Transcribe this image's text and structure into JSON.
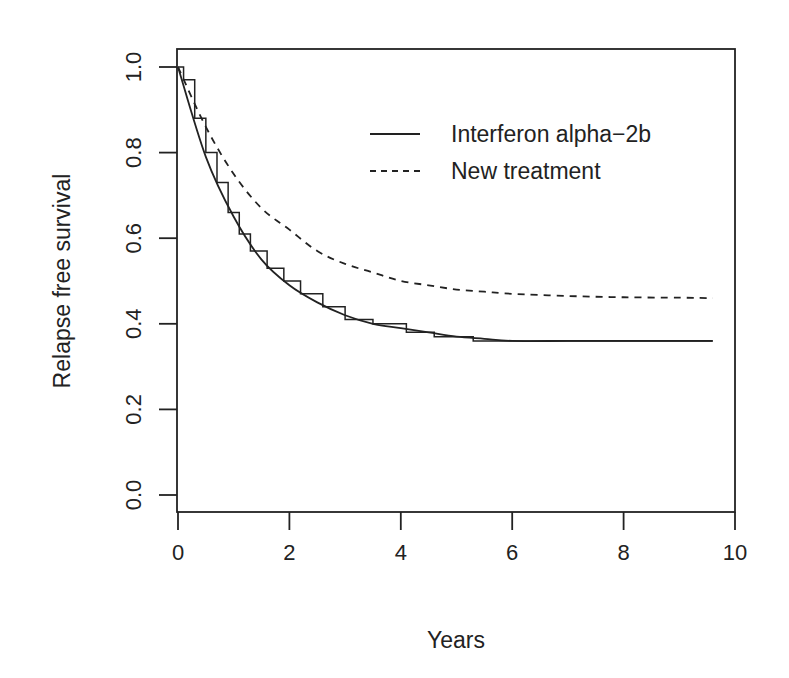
{
  "chart_data": {
    "type": "line",
    "title": "",
    "xlabel": "Years",
    "ylabel": "Relapse free survival",
    "xlim": [
      0,
      10
    ],
    "ylim": [
      0,
      1
    ],
    "x_ticks": [
      "0",
      "2",
      "4",
      "6",
      "8",
      "10"
    ],
    "y_ticks": [
      "0.0",
      "0.2",
      "0.4",
      "0.6",
      "0.8",
      "1.0"
    ],
    "grid": false,
    "legend_position": "top-right",
    "series": [
      {
        "name": "Interferon alpha-2b",
        "style": "solid",
        "x": [
          0,
          0.5,
          1,
          1.5,
          2,
          2.5,
          3,
          3.5,
          4,
          4.5,
          5,
          5.5,
          6,
          7,
          8,
          9,
          9.6
        ],
        "values": [
          1.0,
          0.79,
          0.65,
          0.55,
          0.49,
          0.45,
          0.42,
          0.4,
          0.39,
          0.38,
          0.37,
          0.365,
          0.36,
          0.36,
          0.36,
          0.36,
          0.36
        ]
      },
      {
        "name": "Interferon alpha-2b (Kaplan-Meier)",
        "style": "step",
        "x": [
          0,
          0.1,
          0.3,
          0.5,
          0.7,
          0.9,
          1.1,
          1.3,
          1.6,
          1.9,
          2.2,
          2.6,
          3.0,
          3.5,
          4.1,
          4.6,
          5.3,
          9.6
        ],
        "values": [
          1.0,
          0.97,
          0.88,
          0.8,
          0.73,
          0.66,
          0.61,
          0.57,
          0.53,
          0.5,
          0.47,
          0.44,
          0.41,
          0.4,
          0.38,
          0.37,
          0.36,
          0.36
        ]
      },
      {
        "name": "New treatment",
        "style": "dashed",
        "x": [
          0,
          0.5,
          1,
          1.5,
          2,
          2.5,
          3,
          3.5,
          4,
          4.5,
          5,
          5.5,
          6,
          7,
          8,
          9,
          9.6
        ],
        "values": [
          1.0,
          0.86,
          0.75,
          0.67,
          0.62,
          0.57,
          0.54,
          0.52,
          0.5,
          0.49,
          0.48,
          0.475,
          0.47,
          0.465,
          0.462,
          0.461,
          0.46
        ]
      }
    ]
  },
  "legend": {
    "items": [
      {
        "label": "Interferon alpha−2b",
        "style": "solid"
      },
      {
        "label": "New treatment",
        "style": "dashed"
      }
    ]
  },
  "axes": {
    "xlabel": "Years",
    "ylabel": "Relapse free survival",
    "x_ticks": [
      "0",
      "2",
      "4",
      "6",
      "8",
      "10"
    ],
    "y_ticks": [
      "0.0",
      "0.2",
      "0.4",
      "0.6",
      "0.8",
      "1.0"
    ]
  }
}
